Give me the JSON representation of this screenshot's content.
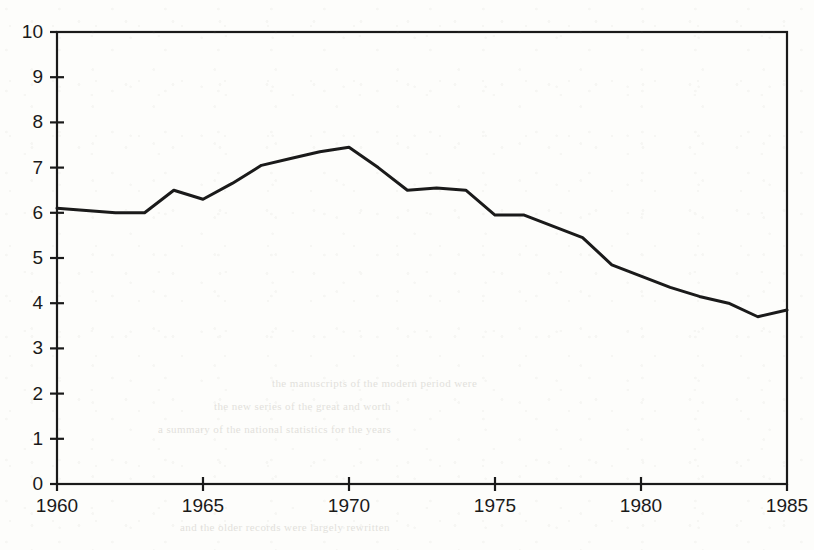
{
  "chart_data": {
    "type": "line",
    "title": "",
    "subtitle": "",
    "xlabel": "",
    "ylabel": "",
    "xlim": [
      1960,
      1985
    ],
    "ylim": [
      0,
      10
    ],
    "grid": false,
    "legend": null,
    "y_ticks": [
      "0",
      "1",
      "2",
      "3",
      "4",
      "5",
      "6",
      "7",
      "8",
      "9",
      "10"
    ],
    "y_tick_values": [
      0,
      1,
      2,
      3,
      4,
      5,
      6,
      7,
      8,
      9,
      10
    ],
    "x_ticks": [
      "1960",
      "1965",
      "1970",
      "1975",
      "1980",
      "1985"
    ],
    "x_tick_values": [
      1960,
      1965,
      1970,
      1975,
      1980,
      1985
    ],
    "x": [
      1960,
      1961,
      1962,
      1963,
      1964,
      1965,
      1966,
      1967,
      1968,
      1969,
      1970,
      1971,
      1972,
      1973,
      1974,
      1975,
      1976,
      1977,
      1978,
      1979,
      1980,
      1981,
      1982,
      1983,
      1984,
      1985
    ],
    "series": [
      {
        "name": "series-1",
        "color": "#1a1a1a",
        "values": [
          6.1,
          6.05,
          6.0,
          6.0,
          6.5,
          6.3,
          6.65,
          7.05,
          7.2,
          7.35,
          7.45,
          7.0,
          6.5,
          6.55,
          6.5,
          5.95,
          5.95,
          5.7,
          5.45,
          4.85,
          4.6,
          4.35,
          4.15,
          4.0,
          3.7,
          3.85
        ]
      }
    ]
  },
  "axes": {
    "frame_color": "#1a1a1a",
    "line_color": "#1a1a1a"
  },
  "background_artifacts": {
    "ghost_lines": [
      "the manuscripts of the modern period were",
      "the new series of the great and worth",
      "a summary of the national statistics for the years",
      "and the older records were largely rewritten"
    ]
  }
}
